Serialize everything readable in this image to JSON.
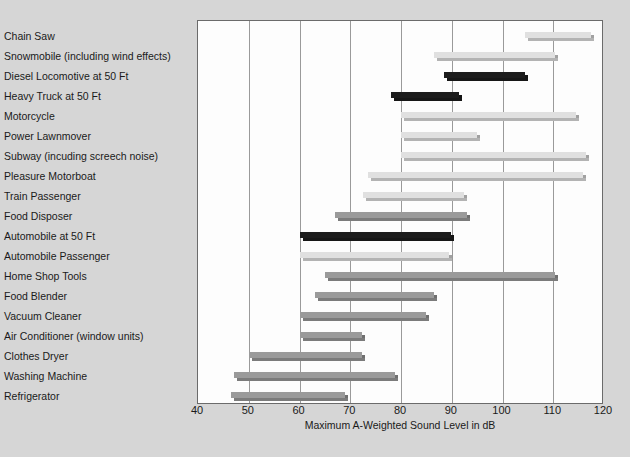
{
  "chart_data": {
    "type": "bar",
    "subtype": "horizontal-range-bar",
    "title": "",
    "xlabel": "Maximum A-Weighted Sound Level in dB",
    "ylabel": "",
    "xlim": [
      40,
      120
    ],
    "xticks": [
      40,
      50,
      60,
      70,
      80,
      90,
      100,
      110,
      120
    ],
    "grid": "vertical",
    "legend_position": "inside-bottom-right",
    "legend_title": "MEASUREMENT LOCATION",
    "series": [
      {
        "name": "Outdoors",
        "color": "#1c1c1c"
      },
      {
        "name": "Operator/ Passenger",
        "color": "#e0e0e0"
      },
      {
        "name": "In Home",
        "color": "#9a9a9a"
      }
    ],
    "categories": [
      "Chain Saw",
      "Snowmobile (including wind effects)",
      "Diesel Locomotive at 50 Ft",
      "Heavy Truck at 50 Ft",
      "Motorcycle",
      "Power Lawnmover",
      "Subway (incuding screech noise)",
      "Pleasure Motorboat",
      "Train Passenger",
      "Food Disposer",
      "Automobile at 50 Ft",
      "Automobile Passenger",
      "Home Shop Tools",
      "Food Blender",
      "Vacuum Cleaner",
      "Air Conditioner (window units)",
      "Clothes Dryer",
      "Washing Machine",
      "Refrigerator"
    ],
    "bars": [
      {
        "category": "Chain Saw",
        "start": 104.5,
        "end": 118.0,
        "series": "Operator/ Passenger"
      },
      {
        "category": "Snowmobile (including wind effects)",
        "start": 86.5,
        "end": 111.0,
        "series": "Operator/ Passenger"
      },
      {
        "category": "Diesel Locomotive at 50 Ft",
        "start": 88.5,
        "end": 105.0,
        "series": "Outdoors"
      },
      {
        "category": "Heavy Truck at 50 Ft",
        "start": 78.0,
        "end": 92.0,
        "series": "Outdoors"
      },
      {
        "category": "Motorcycle",
        "start": 80.0,
        "end": 115.0,
        "series": "Operator/ Passenger"
      },
      {
        "category": "Power Lawnmover",
        "start": 80.0,
        "end": 95.5,
        "series": "Operator/ Passenger"
      },
      {
        "category": "Subway (incuding screech noise)",
        "start": 80.0,
        "end": 117.0,
        "series": "Operator/ Passenger"
      },
      {
        "category": "Pleasure Motorboat",
        "start": 73.5,
        "end": 116.5,
        "series": "Operator/ Passenger"
      },
      {
        "category": "Train Passenger",
        "start": 72.5,
        "end": 93.0,
        "series": "Operator/ Passenger"
      },
      {
        "category": "Food Disposer",
        "start": 67.0,
        "end": 93.5,
        "series": "In Home"
      },
      {
        "category": "Automobile at 50 Ft",
        "start": 60.0,
        "end": 90.5,
        "series": "Outdoors"
      },
      {
        "category": "Automobile Passenger",
        "start": 60.0,
        "end": 90.0,
        "series": "Operator/ Passenger"
      },
      {
        "category": "Home Shop Tools",
        "start": 65.0,
        "end": 111.0,
        "series": "In Home"
      },
      {
        "category": "Food Blender",
        "start": 63.0,
        "end": 87.0,
        "series": "In Home"
      },
      {
        "category": "Vacuum Cleaner",
        "start": 60.0,
        "end": 85.5,
        "series": "In Home"
      },
      {
        "category": "Air Conditioner (window units)",
        "start": 60.0,
        "end": 73.0,
        "series": "In Home"
      },
      {
        "category": "Clothes Dryer",
        "start": 50.0,
        "end": 73.0,
        "series": "In Home"
      },
      {
        "category": "Washing Machine",
        "start": 47.0,
        "end": 79.5,
        "series": "In Home"
      },
      {
        "category": "Refrigerator",
        "start": 46.5,
        "end": 69.5,
        "series": "In Home"
      }
    ]
  },
  "colors": {
    "page_background": "#d6d6d6",
    "plot_background": "#fdfdfd",
    "gridline": "#9a9a9a",
    "frame": "#6b6b6b",
    "text": "#1a1a1a",
    "outdoors": "#1c1c1c",
    "operator_passenger": "#e0e0e0",
    "in_home": "#9a9a9a"
  }
}
